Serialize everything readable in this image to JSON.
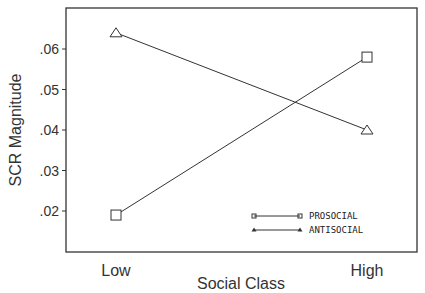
{
  "chart_data": {
    "type": "line",
    "title": "",
    "xlabel": "Social Class",
    "ylabel": "SCR Magnitude",
    "categories": [
      "Low",
      "High"
    ],
    "series": [
      {
        "name": "PROSOCIAL",
        "marker": "square",
        "values": [
          0.019,
          0.058
        ]
      },
      {
        "name": "ANTISOCIAL",
        "marker": "triangle",
        "values": [
          0.064,
          0.04
        ]
      }
    ],
    "yticks": [
      ".02",
      ".03",
      ".04",
      ".05",
      ".06"
    ],
    "ytick_values": [
      0.02,
      0.03,
      0.04,
      0.05,
      0.06
    ],
    "ylim": [
      0.0099,
      0.0703
    ],
    "grid": false,
    "legend_position": "lower right inside"
  }
}
